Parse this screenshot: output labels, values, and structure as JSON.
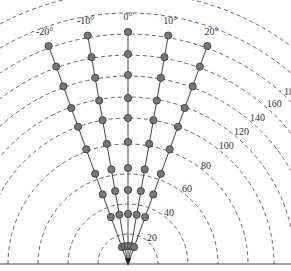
{
  "diagram": {
    "type": "polar-fan",
    "origin": {
      "x": 128,
      "y": 264
    },
    "angle_labels": [
      "-20°",
      "-10°",
      "0°",
      "10°",
      "20°"
    ],
    "angles_deg": [
      -20,
      -10,
      0,
      10,
      20
    ],
    "range_labels": [
      "20",
      "40",
      "60",
      "80",
      "100",
      "120",
      "140",
      "160",
      "180",
      "200",
      "230"
    ],
    "arc_radii_px": [
      30,
      60,
      90,
      120,
      146,
      167,
      188,
      209,
      230,
      251,
      272
    ],
    "node_radii_px": [
      18,
      50,
      74,
      96,
      122,
      146,
      166,
      189,
      210,
      232
    ],
    "colors": {
      "line": "#444444",
      "node_fill": "#777777",
      "arc": "#555555"
    }
  }
}
